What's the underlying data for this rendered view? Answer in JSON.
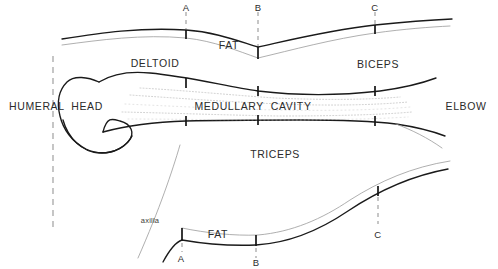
{
  "figure": {
    "background_color": "#ffffff",
    "line_color": "#1a1a1a",
    "faint_line_color": "#9a9a9a"
  },
  "labels": {
    "fat_upper": "FAT",
    "fat_lower": "FAT",
    "deltoid": "DELTOID",
    "biceps": "BICEPS",
    "triceps": "TRICEPS",
    "medullary_cavity": "MEDULLARY  CAVITY",
    "humeral_head": "HUMERAL  HEAD",
    "elbow": "ELBOW",
    "axilla": "axilla"
  },
  "markers": {
    "top": [
      {
        "id": "A",
        "label": "A",
        "x": 186
      },
      {
        "id": "B",
        "label": "B",
        "x": 258
      },
      {
        "id": "C",
        "label": "C",
        "x": 375
      }
    ],
    "bottom": [
      {
        "id": "A",
        "label": "A",
        "x": 182
      },
      {
        "id": "B",
        "label": "B",
        "x": 256
      },
      {
        "id": "C",
        "label": "C",
        "x": 378
      }
    ]
  },
  "guides": {
    "humeral_head_dashed_x": 53,
    "top_dashed_a_x": 186,
    "top_dashed_b_x": 258,
    "top_dashed_c_x": 375,
    "bottom_dashed_c_x": 378
  }
}
